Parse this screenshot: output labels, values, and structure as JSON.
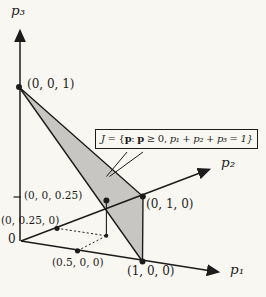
{
  "figure": {
    "type": "3d-probability-simplex-diagram",
    "axis_labels": {
      "p1": "p₁",
      "p2": "p₂",
      "p3": "p₃"
    },
    "origin_label": "0",
    "point_labels": {
      "e3": "(0, 0, 1)",
      "e2": "(0, 1, 0)",
      "e1": "(1, 0, 0)",
      "half_e1": "(0.5, 0, 0)",
      "quarter_e2": "(0, 0.25, 0)",
      "quarter_e3": "(0, 0, 0.25)"
    },
    "callout": {
      "set_symbol": "J",
      "eq_brace": " = {",
      "p_vector_1": "p",
      "colon": ": ",
      "p_vector_2": "p",
      "geq_zero": " ≥ 0, ",
      "sum_condition": "p₁ + p₂ + p₃ = 1}"
    },
    "colors": {
      "background": "#f9f7f2",
      "ink": "#1c1c1c",
      "simplex_fill": "#c7c6c2"
    }
  }
}
